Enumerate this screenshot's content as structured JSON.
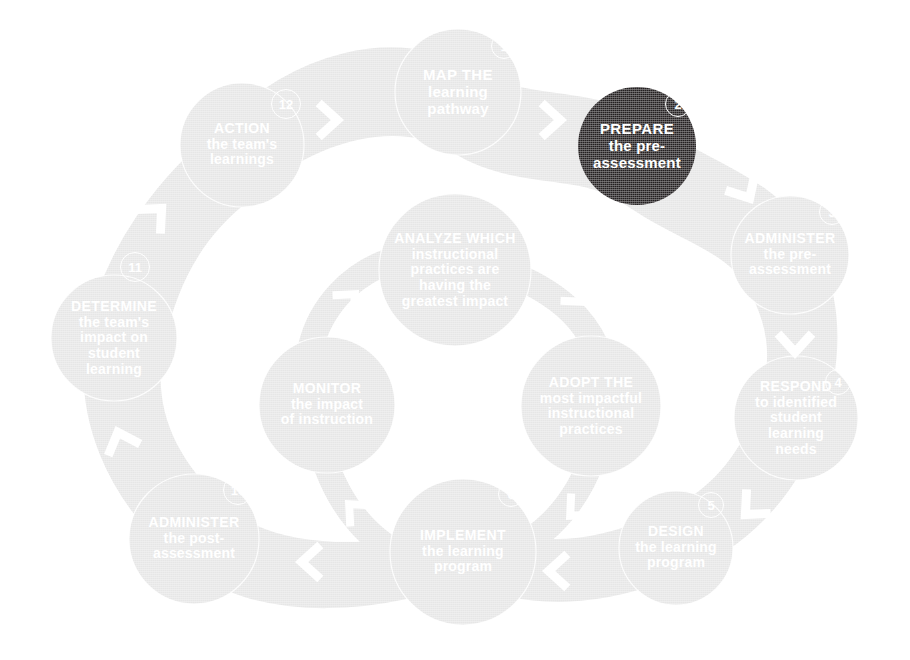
{
  "diagram": {
    "type": "cycle-diagram",
    "colors": {
      "background": "#ffffff",
      "node_fill": "#e6e6e6",
      "node_fill_light": "#ededed",
      "band_fill": "#e2e2e2",
      "band_fill_light": "#ebebeb",
      "highlight_fill": "#231f20",
      "label_text": "#ffffff",
      "chevron": "#ffffff"
    },
    "highlighted_step": 2,
    "steps": [
      {
        "number": "1",
        "title": "MAP",
        "subtitle": "the\nlearning\npathway",
        "lines": [
          "MAP the",
          "learning",
          "pathway"
        ],
        "state": "normal",
        "ring": "outer",
        "cx": 458,
        "cy": 92,
        "r": 63,
        "badge_x": 504,
        "badge_y": 46,
        "font_size": 15
      },
      {
        "number": "2",
        "title": "PREPARE",
        "subtitle": "the pre-\nassessment",
        "lines": [
          "PREPARE",
          "the pre-",
          "assessment"
        ],
        "state": "highlighted",
        "ring": "outer",
        "cx": 637,
        "cy": 146,
        "r": 59,
        "badge_x": 678,
        "badge_y": 104,
        "font_size": 15
      },
      {
        "number": "3",
        "title": "ADMINISTER",
        "subtitle": "the pre-\nassessment",
        "lines": [
          "ADMINISTER",
          "the pre-",
          "assessment"
        ],
        "state": "normal",
        "ring": "outer",
        "cx": 790,
        "cy": 255,
        "r": 59,
        "badge_x": 832,
        "badge_y": 212,
        "font_size": 14
      },
      {
        "number": "4",
        "title": "RESPOND",
        "subtitle": "to identified\nstudent\nlearning\nneeds",
        "lines": [
          "RESPOND",
          "to identified",
          "student",
          "learning",
          "needs"
        ],
        "state": "normal",
        "ring": "outer",
        "cx": 796,
        "cy": 418,
        "r": 62,
        "badge_x": 838,
        "badge_y": 382,
        "font_size": 14
      },
      {
        "number": "5",
        "title": "DESIGN",
        "subtitle": "the learning\nprogram",
        "lines": [
          "DESIGN",
          "the learning",
          "program"
        ],
        "state": "normal",
        "ring": "outer",
        "cx": 676,
        "cy": 548,
        "r": 57,
        "badge_x": 711,
        "badge_y": 505,
        "font_size": 14
      },
      {
        "number": "6",
        "title": "IMPLEMENT",
        "subtitle": "the learning\nprogram",
        "lines": [
          "IMPLEMENT",
          "the learning",
          "program"
        ],
        "state": "normal",
        "ring": "outer",
        "cx": 463,
        "cy": 552,
        "r": 73,
        "badge_x": 511,
        "badge_y": 494,
        "font_size": 14
      },
      {
        "number": "7",
        "title": "MONITOR",
        "subtitle": "the impact\nof instruction",
        "lines": [
          "MONITOR",
          "the impact",
          "of instruction"
        ],
        "state": "normal",
        "ring": "inner",
        "cx": 327,
        "cy": 405,
        "r": 68,
        "badge_x": 385,
        "badge_y": 349,
        "font_size": 14
      },
      {
        "number": "8",
        "title": "ANALYZE",
        "subtitle": "which\ninstructional\npractices are\nhaving the\ngreatest impact",
        "lines": [
          "ANALYZE which",
          "instructional",
          "practices are",
          "having the",
          "greatest impact"
        ],
        "state": "normal",
        "ring": "inner",
        "cx": 455,
        "cy": 270,
        "r": 76,
        "badge_x": 504,
        "badge_y": 189,
        "font_size": 14
      },
      {
        "number": "9",
        "title": "ADOPT",
        "subtitle": "the\nmost impactful\ninstructional\npractices",
        "lines": [
          "ADOPT the",
          "most impactful",
          "instructional",
          "practices"
        ],
        "state": "normal",
        "ring": "inner",
        "cx": 591,
        "cy": 406,
        "r": 70,
        "badge_x": 650,
        "badge_y": 349,
        "font_size": 14
      },
      {
        "number": "10",
        "title": "ADMINISTER",
        "subtitle": "the post-\nassessment",
        "lines": [
          "ADMINISTER",
          "the post-",
          "assessment"
        ],
        "state": "normal",
        "ring": "outer",
        "cx": 194,
        "cy": 539,
        "r": 65,
        "badge_x": 238,
        "badge_y": 490,
        "font_size": 14
      },
      {
        "number": "11",
        "title": "DETERMINE",
        "subtitle": "the team's\nimpact on\nstudent\nlearning",
        "lines": [
          "DETERMINE",
          "the team's",
          "impact on",
          "student",
          "learning"
        ],
        "state": "normal",
        "ring": "outer",
        "cx": 114,
        "cy": 338,
        "r": 63,
        "badge_x": 135,
        "badge_y": 267,
        "font_size": 14
      },
      {
        "number": "12",
        "title": "ACTION",
        "subtitle": "the team's\nlearnings",
        "lines": [
          "ACTION",
          "the team's",
          "learnings"
        ],
        "state": "normal",
        "ring": "outer",
        "cx": 242,
        "cy": 145,
        "r": 62,
        "badge_x": 286,
        "badge_y": 104,
        "font_size": 14
      }
    ],
    "connectors": [
      {
        "name": "chevron-12-to-1",
        "x": 328,
        "y": 120,
        "rotation": 0,
        "size": 34
      },
      {
        "name": "chevron-1-to-2",
        "x": 551,
        "y": 120,
        "rotation": 0,
        "size": 34
      },
      {
        "name": "chevron-2-to-3",
        "x": 745,
        "y": 190,
        "rotation": 60,
        "size": 34
      },
      {
        "name": "chevron-3-to-4",
        "x": 795,
        "y": 343,
        "rotation": 90,
        "size": 34
      },
      {
        "name": "chevron-4-to-5",
        "x": 752,
        "y": 508,
        "rotation": 135,
        "size": 34
      },
      {
        "name": "chevron-5-to-6",
        "x": 558,
        "y": 571,
        "rotation": 180,
        "size": 34
      },
      {
        "name": "chevron-6-to-10",
        "x": 311,
        "y": 562,
        "rotation": 180,
        "size": 34
      },
      {
        "name": "chevron-10-to-11",
        "x": 121,
        "y": 441,
        "rotation": 250,
        "size": 34
      },
      {
        "name": "chevron-11-to-12",
        "x": 155,
        "y": 215,
        "rotation": 315,
        "size": 34
      },
      {
        "name": "chevron-inner-7-to-8",
        "x": 349,
        "y": 300,
        "rotation": 315,
        "size": 30
      },
      {
        "name": "chevron-inner-8-to-9",
        "x": 577,
        "y": 296,
        "rotation": 45,
        "size": 30
      },
      {
        "name": "chevron-inner-9-to-6",
        "x": 576,
        "y": 510,
        "rotation": 135,
        "size": 30
      },
      {
        "name": "chevron-inner-6-to-7",
        "x": 355,
        "y": 510,
        "rotation": 225,
        "size": 30
      }
    ]
  }
}
